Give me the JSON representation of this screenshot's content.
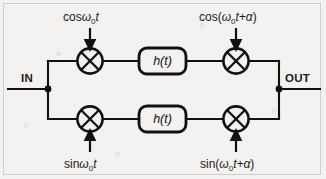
{
  "figure": {
    "background_color": "#f3f2f0",
    "ink_color": "#111111"
  },
  "ports": {
    "input_label": "IN",
    "output_label": "OUT"
  },
  "branches": [
    {
      "name": "in-phase",
      "mixer_in": {
        "name": "mixer-top-left",
        "symbol": "⊗"
      },
      "carrier_in": {
        "cos": "cos",
        "omega": "ω",
        "sub": "0",
        "t": "t",
        "full": "cosω0t"
      },
      "filter": {
        "label": "h(t)",
        "name": "filter-top"
      },
      "mixer_out": {
        "name": "mixer-top-right",
        "symbol": "⊗"
      },
      "carrier_out": {
        "prefix": "cos(",
        "omega": "ω",
        "sub": "0",
        "mid": "t+",
        "alpha": "α",
        "suffix": ")",
        "full": "cos(ω0t+α)"
      }
    },
    {
      "name": "quadrature",
      "mixer_in": {
        "name": "mixer-bottom-left",
        "symbol": "⊗"
      },
      "carrier_in": {
        "sin": "sin",
        "omega": "ω",
        "sub": "0",
        "t": "t",
        "full": "sinω0t"
      },
      "filter": {
        "label": "h(t)",
        "name": "filter-bottom"
      },
      "mixer_out": {
        "name": "mixer-bottom-right",
        "symbol": "⊗"
      },
      "carrier_out": {
        "prefix": "sin(",
        "omega": "ω",
        "sub": "0",
        "mid": "t+",
        "alpha": "α",
        "suffix": ")",
        "full": "sin(ω0t+α)"
      }
    }
  ]
}
